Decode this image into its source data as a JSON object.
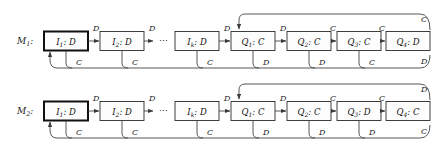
{
  "figure": {
    "type": "state-machine-diagram",
    "machines": [
      {
        "id": "M1",
        "label": "M",
        "label_sub": "1",
        "label_colon": ":",
        "states": [
          {
            "name": "I",
            "sub": "1",
            "sep": ":",
            "action": "D",
            "start": true
          },
          {
            "name": "I",
            "sub": "2",
            "sep": ":",
            "action": "D",
            "start": false
          },
          {
            "name": "I",
            "sub": "k",
            "sep": ":",
            "action": "D",
            "start": false
          },
          {
            "name": "Q",
            "sub": "1",
            "sep": ":",
            "action": "C",
            "start": false
          },
          {
            "name": "Q",
            "sub": "2",
            "sep": ":",
            "action": "C",
            "start": false
          },
          {
            "name": "Q",
            "sub": "3",
            "sep": ":",
            "action": "C",
            "start": false
          },
          {
            "name": "Q",
            "sub": "4",
            "sep": ":",
            "action": "D",
            "start": false
          }
        ],
        "forward_labels": [
          "D",
          "D",
          "D",
          "D",
          "C",
          "C",
          "D"
        ],
        "return_labels": [
          "C",
          "C",
          "C",
          "D",
          "D",
          "C"
        ],
        "loop_top_label": "C",
        "loop_bottom_label": "D",
        "ellipsis": "⋯"
      },
      {
        "id": "M2",
        "label": "M",
        "label_sub": "2",
        "label_colon": ":",
        "states": [
          {
            "name": "I",
            "sub": "1",
            "sep": ":",
            "action": "D",
            "start": true
          },
          {
            "name": "I",
            "sub": "2",
            "sep": ":",
            "action": "D",
            "start": false
          },
          {
            "name": "I",
            "sub": "k",
            "sep": ":",
            "action": "D",
            "start": false
          },
          {
            "name": "Q",
            "sub": "1",
            "sep": ":",
            "action": "C",
            "start": false
          },
          {
            "name": "Q",
            "sub": "2",
            "sep": ":",
            "action": "C",
            "start": false
          },
          {
            "name": "Q",
            "sub": "3",
            "sep": ":",
            "action": "D",
            "start": false
          },
          {
            "name": "Q",
            "sub": "4",
            "sep": ":",
            "action": "C",
            "start": false
          }
        ],
        "forward_labels": [
          "D",
          "D",
          "D",
          "D",
          "C",
          "C",
          "C"
        ],
        "return_labels": [
          "C",
          "C",
          "C",
          "D",
          "D",
          "D"
        ],
        "loop_top_label": "D",
        "loop_bottom_label": "C",
        "ellipsis": "⋯"
      }
    ],
    "colors": {
      "background": "#ffffff",
      "box_fill": "#fdfdfd",
      "box_stroke": "#2a2a2a",
      "edge_stroke": "#3a3a3a",
      "text": "#111111"
    }
  }
}
